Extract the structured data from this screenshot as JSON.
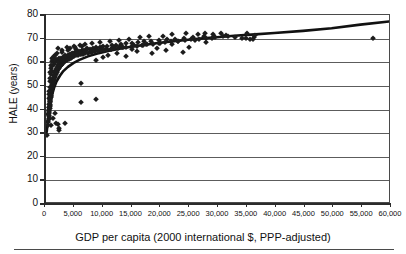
{
  "chart_data": {
    "type": "scatter",
    "title": "",
    "xlabel": "GDP per capita (2000 international $, PPP-adjusted)",
    "ylabel": "HALE (years)",
    "xlim": [
      0,
      60000
    ],
    "ylim": [
      0,
      80
    ],
    "xticks": [
      0,
      5000,
      10000,
      15000,
      20000,
      25000,
      30000,
      35000,
      40000,
      45000,
      50000,
      55000,
      60000
    ],
    "xtick_labels": [
      "0",
      "5,000",
      "10,000",
      "15,000",
      "20,000",
      "25,000",
      "30,000",
      "35,000",
      "40,000",
      "45,000",
      "50,000",
      "55,000",
      "60,000"
    ],
    "yticks": [
      0,
      10,
      20,
      30,
      40,
      50,
      60,
      70,
      80
    ],
    "ytick_labels": [
      "0",
      "10",
      "20",
      "30",
      "40",
      "50",
      "60",
      "70",
      "80"
    ],
    "grid": "horizontal",
    "legend": "none",
    "marker_shape": "diamond",
    "marker_color": "#1c1c1c",
    "trendline_color": "#111111",
    "trendline_note": "logarithmic fit rising steeply from about 30 years near zero GDP to about 77 years at 60,000",
    "trendline_points": [
      [
        300,
        30.0
      ],
      [
        600,
        37.0
      ],
      [
        900,
        42.0
      ],
      [
        1200,
        45.5
      ],
      [
        1600,
        49.0
      ],
      [
        2000,
        51.5
      ],
      [
        2600,
        54.0
      ],
      [
        3200,
        56.0
      ],
      [
        4000,
        57.8
      ],
      [
        5000,
        59.5
      ],
      [
        6000,
        60.8
      ],
      [
        7500,
        62.3
      ],
      [
        9000,
        63.4
      ],
      [
        11000,
        64.6
      ],
      [
        13000,
        65.6
      ],
      [
        15000,
        66.4
      ],
      [
        17500,
        67.3
      ],
      [
        20000,
        68.1
      ],
      [
        22500,
        68.8
      ],
      [
        25000,
        69.4
      ],
      [
        27500,
        70.0
      ],
      [
        30000,
        70.5
      ],
      [
        33000,
        71.1
      ],
      [
        36000,
        71.6
      ],
      [
        40000,
        72.3
      ],
      [
        45000,
        73.2
      ],
      [
        50000,
        74.3
      ],
      [
        55000,
        75.9
      ],
      [
        60000,
        77.2
      ]
    ],
    "points": [
      [
        420,
        29.2
      ],
      [
        520,
        33.5
      ],
      [
        560,
        34.6
      ],
      [
        600,
        35.1
      ],
      [
        620,
        36.0
      ],
      [
        650,
        36.6
      ],
      [
        680,
        37.2
      ],
      [
        700,
        37.8
      ],
      [
        720,
        38.4
      ],
      [
        740,
        39.0
      ],
      [
        760,
        39.6
      ],
      [
        780,
        40.2
      ],
      [
        800,
        40.8
      ],
      [
        820,
        41.3
      ],
      [
        840,
        41.9
      ],
      [
        860,
        42.5
      ],
      [
        880,
        43.0
      ],
      [
        900,
        43.6
      ],
      [
        920,
        44.1
      ],
      [
        940,
        44.7
      ],
      [
        960,
        45.2
      ],
      [
        980,
        45.8
      ],
      [
        1000,
        46.3
      ],
      [
        1040,
        46.9
      ],
      [
        1080,
        47.4
      ],
      [
        1120,
        48.0
      ],
      [
        1160,
        48.5
      ],
      [
        1200,
        49.0
      ],
      [
        1240,
        49.5
      ],
      [
        1280,
        50.0
      ],
      [
        1320,
        50.5
      ],
      [
        1360,
        51.0
      ],
      [
        1400,
        51.4
      ],
      [
        1450,
        51.9
      ],
      [
        1500,
        52.4
      ],
      [
        1560,
        52.9
      ],
      [
        1620,
        53.3
      ],
      [
        1680,
        53.8
      ],
      [
        1740,
        54.2
      ],
      [
        1800,
        54.6
      ],
      [
        1870,
        55.0
      ],
      [
        1940,
        55.4
      ],
      [
        2010,
        55.8
      ],
      [
        2080,
        56.2
      ],
      [
        2160,
        56.6
      ],
      [
        2240,
        57.0
      ],
      [
        2320,
        57.3
      ],
      [
        2400,
        57.7
      ],
      [
        2500,
        58.0
      ],
      [
        2600,
        58.4
      ],
      [
        2700,
        58.7
      ],
      [
        2800,
        59.0
      ],
      [
        2900,
        59.3
      ],
      [
        3000,
        59.6
      ],
      [
        3150,
        59.9
      ],
      [
        3300,
        60.2
      ],
      [
        3450,
        60.5
      ],
      [
        3600,
        60.8
      ],
      [
        3750,
        61.0
      ],
      [
        3900,
        61.3
      ],
      [
        4100,
        61.5
      ],
      [
        4300,
        61.8
      ],
      [
        4500,
        62.0
      ],
      [
        4700,
        62.2
      ],
      [
        4900,
        62.5
      ],
      [
        5100,
        62.7
      ],
      [
        5400,
        62.9
      ],
      [
        5700,
        63.1
      ],
      [
        6000,
        63.3
      ],
      [
        6300,
        63.5
      ],
      [
        6600,
        63.7
      ],
      [
        7000,
        63.9
      ],
      [
        7400,
        64.1
      ],
      [
        7800,
        64.3
      ],
      [
        8200,
        64.5
      ],
      [
        8700,
        64.7
      ],
      [
        9200,
        64.9
      ],
      [
        9700,
        65.1
      ],
      [
        10200,
        65.3
      ],
      [
        10800,
        65.5
      ],
      [
        11400,
        65.7
      ],
      [
        12000,
        65.9
      ],
      [
        12700,
        66.1
      ],
      [
        13400,
        66.3
      ],
      [
        14100,
        66.5
      ],
      [
        15000,
        66.8
      ],
      [
        15900,
        67.0
      ],
      [
        16800,
        67.3
      ],
      [
        17700,
        67.6
      ],
      [
        18700,
        67.9
      ],
      [
        19700,
        68.2
      ],
      [
        20800,
        68.5
      ],
      [
        21900,
        68.8
      ],
      [
        23000,
        69.1
      ],
      [
        24200,
        69.4
      ],
      [
        25400,
        69.7
      ],
      [
        26700,
        70.0
      ],
      [
        28000,
        70.3
      ],
      [
        29400,
        70.6
      ],
      [
        30800,
        70.9
      ],
      [
        700,
        41.0
      ],
      [
        760,
        42.2
      ],
      [
        820,
        43.4
      ],
      [
        880,
        44.6
      ],
      [
        940,
        45.9
      ],
      [
        1010,
        47.1
      ],
      [
        1080,
        48.3
      ],
      [
        1150,
        49.4
      ],
      [
        1230,
        50.6
      ],
      [
        1310,
        51.7
      ],
      [
        1400,
        52.8
      ],
      [
        1490,
        53.8
      ],
      [
        1590,
        54.8
      ],
      [
        1700,
        55.7
      ],
      [
        1810,
        56.5
      ],
      [
        1930,
        57.3
      ],
      [
        2060,
        58.0
      ],
      [
        2200,
        58.7
      ],
      [
        2350,
        59.3
      ],
      [
        2510,
        59.9
      ],
      [
        2680,
        60.4
      ],
      [
        2860,
        60.9
      ],
      [
        3060,
        61.4
      ],
      [
        3270,
        61.8
      ],
      [
        3490,
        62.2
      ],
      [
        3730,
        62.6
      ],
      [
        3990,
        62.9
      ],
      [
        4260,
        63.3
      ],
      [
        4550,
        63.6
      ],
      [
        4870,
        63.9
      ],
      [
        5200,
        64.2
      ],
      [
        5560,
        64.5
      ],
      [
        5940,
        64.7
      ],
      [
        6350,
        65.0
      ],
      [
        6790,
        65.3
      ],
      [
        7260,
        65.5
      ],
      [
        7760,
        65.8
      ],
      [
        8290,
        66.0
      ],
      [
        8860,
        66.3
      ],
      [
        9470,
        66.5
      ],
      [
        10120,
        66.8
      ],
      [
        10820,
        67.0
      ],
      [
        11570,
        67.3
      ],
      [
        12370,
        67.5
      ],
      [
        13220,
        67.8
      ],
      [
        14130,
        68.0
      ],
      [
        15100,
        68.3
      ],
      [
        16140,
        68.5
      ],
      [
        17250,
        68.8
      ],
      [
        18440,
        69.1
      ],
      [
        19710,
        69.4
      ],
      [
        21070,
        69.7
      ],
      [
        22520,
        70.0
      ],
      [
        24070,
        70.3
      ],
      [
        25720,
        70.6
      ],
      [
        27490,
        70.9
      ],
      [
        29380,
        71.2
      ],
      [
        31400,
        71.5
      ],
      [
        900,
        56.0
      ],
      [
        1100,
        57.5
      ],
      [
        1300,
        58.6
      ],
      [
        1500,
        59.4
      ],
      [
        1800,
        60.2
      ],
      [
        2100,
        60.8
      ],
      [
        2400,
        61.4
      ],
      [
        2800,
        61.9
      ],
      [
        3200,
        62.4
      ],
      [
        3700,
        62.8
      ],
      [
        4200,
        63.2
      ],
      [
        4800,
        63.6
      ],
      [
        5500,
        64.0
      ],
      [
        6200,
        64.3
      ],
      [
        7000,
        64.7
      ],
      [
        8000,
        65.0
      ],
      [
        9000,
        65.4
      ],
      [
        10500,
        65.8
      ],
      [
        12000,
        66.2
      ],
      [
        13500,
        66.6
      ],
      [
        15500,
        67.1
      ],
      [
        17500,
        67.6
      ],
      [
        20000,
        68.2
      ],
      [
        23000,
        68.9
      ],
      [
        26000,
        69.6
      ],
      [
        29000,
        70.3
      ],
      [
        1700,
        63.0
      ],
      [
        2100,
        63.8
      ],
      [
        2500,
        62.0
      ],
      [
        3000,
        64.5
      ],
      [
        3400,
        63.0
      ],
      [
        4000,
        65.0
      ],
      [
        4600,
        64.0
      ],
      [
        5300,
        65.5
      ],
      [
        6100,
        64.4
      ],
      [
        7200,
        66.0
      ],
      [
        8400,
        65.2
      ],
      [
        9800,
        66.4
      ],
      [
        11500,
        65.6
      ],
      [
        13000,
        67.0
      ],
      [
        15000,
        65.8
      ],
      [
        17000,
        67.4
      ],
      [
        19500,
        66.2
      ],
      [
        22000,
        67.8
      ],
      [
        25000,
        66.6
      ],
      [
        28000,
        68.4
      ],
      [
        2200,
        66.0
      ],
      [
        2900,
        65.0
      ],
      [
        3800,
        66.4
      ],
      [
        5000,
        66.8
      ],
      [
        6500,
        67.0
      ],
      [
        8800,
        61.0
      ],
      [
        10000,
        62.2
      ],
      [
        11000,
        63.0
      ],
      [
        12500,
        64.0
      ],
      [
        14000,
        62.6
      ],
      [
        16000,
        64.8
      ],
      [
        18500,
        63.8
      ],
      [
        21000,
        65.0
      ],
      [
        24000,
        64.2
      ],
      [
        26500,
        72.0
      ],
      [
        27800,
        72.4
      ],
      [
        29200,
        71.8
      ],
      [
        30500,
        72.2
      ],
      [
        31800,
        71.0
      ],
      [
        33000,
        70.8
      ],
      [
        34200,
        70.4
      ],
      [
        34900,
        70.2
      ],
      [
        35600,
        69.9
      ],
      [
        36200,
        70.6
      ],
      [
        35000,
        72.2
      ],
      [
        36500,
        71.4
      ],
      [
        22000,
        71.8
      ],
      [
        24500,
        72.3
      ],
      [
        20500,
        71.2
      ],
      [
        18000,
        71.0
      ],
      [
        16500,
        70.6
      ],
      [
        14500,
        69.8
      ],
      [
        12800,
        69.4
      ],
      [
        11200,
        69.0
      ],
      [
        9500,
        68.4
      ],
      [
        8200,
        68.0
      ],
      [
        7000,
        67.6
      ],
      [
        6000,
        67.2
      ],
      [
        5200,
        66.6
      ],
      [
        4400,
        66.2
      ],
      [
        1200,
        62.0
      ],
      [
        1500,
        62.8
      ],
      [
        1900,
        61.2
      ],
      [
        2300,
        60.0
      ],
      [
        2700,
        59.0
      ],
      [
        1000,
        59.0
      ],
      [
        1150,
        60.6
      ],
      [
        1350,
        61.5
      ],
      [
        860,
        52.0
      ],
      [
        940,
        53.5
      ],
      [
        1020,
        55.0
      ],
      [
        1250,
        56.5
      ],
      [
        640,
        45.0
      ],
      [
        690,
        46.5
      ],
      [
        760,
        48.0
      ],
      [
        830,
        49.5
      ],
      [
        580,
        38.0
      ],
      [
        620,
        39.5
      ],
      [
        660,
        41.0
      ],
      [
        2400,
        31.4
      ],
      [
        2450,
        32.0
      ],
      [
        1900,
        34.2
      ],
      [
        2250,
        34.0
      ],
      [
        3400,
        34.1
      ],
      [
        6300,
        43.0
      ],
      [
        8800,
        44.4
      ],
      [
        6300,
        51.2
      ],
      [
        1050,
        33.5
      ],
      [
        1450,
        36.5
      ],
      [
        1700,
        38.5
      ],
      [
        56800,
        70.2
      ],
      [
        36000,
        70.0
      ]
    ]
  },
  "axis": {
    "y_title": "HALE (years)",
    "x_title": "GDP per capita (2000 international $, PPP-adjusted)"
  }
}
